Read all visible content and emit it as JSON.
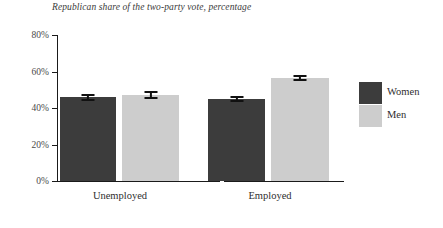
{
  "chart_data": {
    "type": "bar",
    "title": "Republican share of the two-party vote, percentage",
    "subtitle": "",
    "xlabel": "",
    "ylabel": "",
    "categories": [
      "Unemployed",
      "Employed"
    ],
    "series": [
      {
        "name": "Women",
        "color": "#3c3c3c",
        "values": [
          45.8,
          45.0
        ],
        "errors": [
          2.0,
          1.6
        ]
      },
      {
        "name": "Men",
        "color": "#cdcdcd",
        "values": [
          47.2,
          56.4
        ],
        "errors": [
          2.2,
          1.6
        ]
      }
    ],
    "ylim": [
      0,
      85
    ],
    "yticks": [
      0,
      20,
      40,
      60,
      80
    ],
    "ytick_labels": [
      "0%",
      "20%",
      "40%",
      "60%",
      "80%"
    ],
    "grid": false,
    "legend_position": "right",
    "error_bars": true
  },
  "legend": {
    "entries": [
      {
        "label": "Women",
        "color": "#3c3c3c"
      },
      {
        "label": "Men",
        "color": "#cdcdcd"
      }
    ]
  },
  "axis": {
    "y_tick_labels": [
      "80%",
      "60%",
      "40%",
      "20%",
      "0%"
    ],
    "x_group_labels": [
      "Unemployed",
      "Employed"
    ]
  }
}
